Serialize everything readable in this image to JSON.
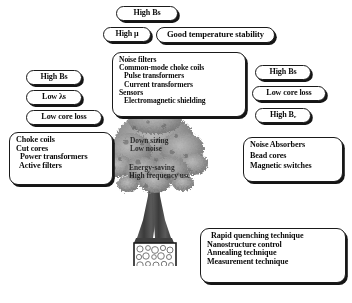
{
  "figure": {
    "background_color": "#ffffff",
    "ink_color": "#111111"
  },
  "top_pills": [
    {
      "label": "High Bs",
      "name": "pill-high-bs-top"
    },
    {
      "label_pre": "High ",
      "label_sym": "μ",
      "label": "High μ",
      "name": "pill-high-mu"
    },
    {
      "label": "Good temperature stability",
      "name": "pill-good-temperature-stability"
    }
  ],
  "left_pills": [
    {
      "label": "High Bs",
      "name": "pill-left-high-bs"
    },
    {
      "label": "Low λs",
      "name": "pill-left-low-lambda-s"
    },
    {
      "label": "Low core loss",
      "name": "pill-left-low-core-loss"
    }
  ],
  "right_pills": [
    {
      "label": "High Bs",
      "name": "pill-right-high-bs"
    },
    {
      "label": "Low core loss",
      "name": "pill-right-low-core-loss"
    },
    {
      "label_pre": "High B",
      "label_sub": "r",
      "label": "High Br",
      "name": "pill-right-high-br"
    }
  ],
  "center_box": {
    "name": "applications-center",
    "items": [
      "Noise filters",
      "Common-mode choke coils",
      "Pulse transformers",
      "Current transformers",
      "Sensors",
      "Electromagnetic shielding"
    ]
  },
  "left_box": {
    "name": "applications-left",
    "items": [
      "Choke coils",
      "Cut cores",
      "Power transformers",
      "Active filters"
    ]
  },
  "right_box": {
    "name": "applications-right",
    "items": [
      "Noise Absorbers",
      "Bead cores",
      "Magnetic switches"
    ]
  },
  "bottom_box": {
    "name": "technologies-bottom",
    "items": [
      "Rapid quenching technique",
      "Nanostructure control",
      "Annealing technique",
      "Measurement technique"
    ]
  },
  "canopy_text": {
    "group_a": [
      "Down sizing",
      "Low noise"
    ],
    "group_b": [
      "Energy-saving",
      "High frequency  use"
    ]
  },
  "tree": {
    "name": "tree-illustration",
    "canopy_color": "#8d8d8d",
    "trunk_color": "#4a4a4a",
    "soil_box_label": "nanostructure-grains"
  }
}
